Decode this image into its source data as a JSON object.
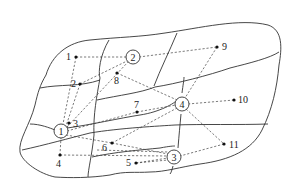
{
  "diagram": {
    "type": "facility-location-network",
    "hubs": [
      {
        "id": "1",
        "label": "1",
        "x": 61,
        "y": 131
      },
      {
        "id": "2",
        "label": "2",
        "x": 133,
        "y": 57
      },
      {
        "id": "3",
        "label": "3",
        "x": 174,
        "y": 157
      },
      {
        "id": "4",
        "label": "4",
        "x": 182,
        "y": 104
      }
    ],
    "points": [
      {
        "id": "p1",
        "label": "1",
        "x": 76,
        "y": 57,
        "lx": 66,
        "ly": 60
      },
      {
        "id": "p2",
        "label": "2",
        "x": 80,
        "y": 84,
        "lx": 71,
        "ly": 87
      },
      {
        "id": "p3",
        "label": "3",
        "x": 69,
        "y": 123,
        "lx": 73,
        "ly": 127
      },
      {
        "id": "p4",
        "label": "4",
        "x": 60,
        "y": 155,
        "lx": 56,
        "ly": 167
      },
      {
        "id": "p5",
        "label": "5",
        "x": 136,
        "y": 163,
        "lx": 126,
        "ly": 166
      },
      {
        "id": "p6",
        "label": "6",
        "x": 112,
        "y": 143,
        "lx": 102,
        "ly": 151
      },
      {
        "id": "p7",
        "label": "7",
        "x": 137,
        "y": 112,
        "lx": 134,
        "ly": 108
      },
      {
        "id": "p8",
        "label": "8",
        "x": 117,
        "y": 73,
        "lx": 114,
        "ly": 84
      },
      {
        "id": "p9",
        "label": "9",
        "x": 217,
        "y": 47,
        "lx": 222,
        "ly": 50
      },
      {
        "id": "p10",
        "label": "10",
        "x": 234,
        "y": 100,
        "lx": 238,
        "ly": 103
      },
      {
        "id": "p11",
        "label": "11",
        "x": 224,
        "y": 144,
        "lx": 229,
        "ly": 148
      }
    ]
  }
}
